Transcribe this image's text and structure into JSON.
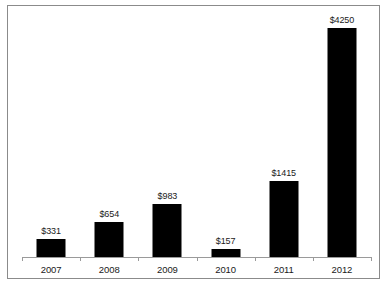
{
  "figure": {
    "background_color": "#ffffff",
    "frame_color": "#8b8b8b",
    "axis_color": "#9a9a9a",
    "bar_color": "#000000",
    "label_color": "#1a1a1a"
  },
  "chart_data": {
    "type": "bar",
    "title": "",
    "subtitle": "",
    "xlabel": "",
    "ylabel": "",
    "categories": [
      "2007",
      "2008",
      "2009",
      "2010",
      "2011",
      "2012"
    ],
    "values": [
      331,
      654,
      983,
      157,
      1415,
      4250
    ],
    "data_labels": [
      "$331",
      "$654",
      "$983",
      "$157",
      "$1415",
      "$4250"
    ],
    "value_prefix": "$",
    "ylim": [
      0,
      4600
    ],
    "grid": false,
    "legend": null,
    "legend_position": "none",
    "axis": {
      "x_axis_visible": true,
      "y_axis_visible": false,
      "y_tick_labels": [],
      "x_tick_labels": [
        "2007",
        "2008",
        "2009",
        "2010",
        "2011",
        "2012"
      ]
    },
    "annotations": []
  }
}
